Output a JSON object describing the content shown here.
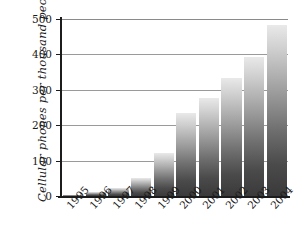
{
  "chart_data": {
    "type": "bar",
    "title": "",
    "xlabel": "",
    "ylabel": "Cellular phones per thousand people",
    "categories": [
      "1995",
      "1996",
      "1997",
      "1998",
      "1999",
      "2000",
      "2001",
      "2002",
      "2003",
      "2004"
    ],
    "values": [
      4,
      11,
      23,
      51,
      121,
      235,
      277,
      333,
      394,
      483
    ],
    "series": [
      {
        "name": "Cellular phones per thousand people",
        "values": [
          4,
          11,
          23,
          51,
          121,
          235,
          277,
          333,
          394,
          483
        ]
      }
    ],
    "ylim": [
      0,
      500
    ],
    "ytick_labels": [
      "0",
      "100",
      "200",
      "300",
      "400",
      "500"
    ],
    "ytick_values": [
      0,
      100,
      200,
      300,
      400,
      500
    ],
    "grid": "horizontal",
    "legend": "none",
    "bar_fill": "vertical-gradient-light-to-dark-gray",
    "colors": {
      "background": "#ffffff",
      "axis": "#1c1c1c",
      "gridline": "#9a9a9a",
      "bar_top": "#e9e9e9",
      "bar_bottom": "#3a3a3a",
      "text": "#1a1a1a"
    }
  }
}
